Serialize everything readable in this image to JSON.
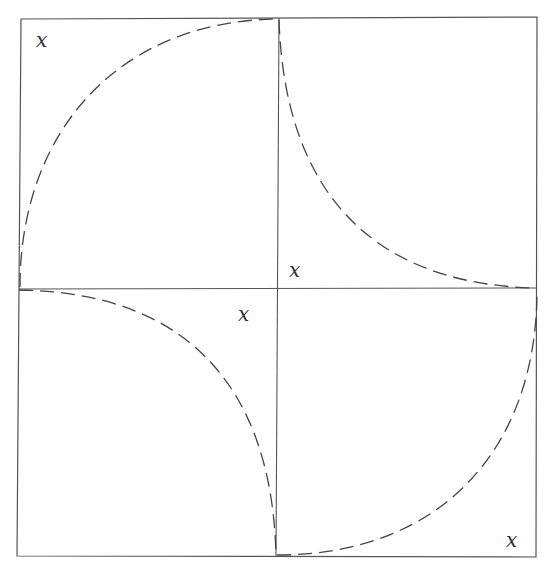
{
  "diagram": {
    "type": "quilt-block-template",
    "colors": {
      "frame": "#555555",
      "curve": "#444444",
      "background": "#ffffff"
    },
    "quadrants": [
      {
        "position": "top-left",
        "curve": "convex toward top-right",
        "mark": "x"
      },
      {
        "position": "top-right",
        "curve": "concave, from top-left corner to bottom-right corner",
        "mark": "x"
      },
      {
        "position": "bottom-left",
        "curve": "concave, from top-left corner to bottom-right corner",
        "mark": "x"
      },
      {
        "position": "bottom-right",
        "curve": "convex toward top-right",
        "mark": "x"
      }
    ],
    "marks": [
      {
        "label": "x",
        "x": 36,
        "y": 32
      },
      {
        "label": "x",
        "x": 289,
        "y": 262
      },
      {
        "label": "x",
        "x": 238,
        "y": 306
      },
      {
        "label": "x",
        "x": 508,
        "y": 532
      }
    ]
  }
}
